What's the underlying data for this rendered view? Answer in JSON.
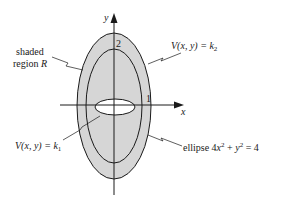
{
  "diagram": {
    "axes": {
      "x_label": "x",
      "y_label": "y"
    },
    "tick_labels": {
      "y_tick": "2",
      "x_tick": "1"
    },
    "labels": {
      "shaded_region_line1": "shaded",
      "shaded_region_line2": "region",
      "shaded_region_var": "R",
      "level_k2_prefix": "V(x, y) = k",
      "level_k2_sub": "2",
      "level_k1_prefix": "V(x, y) = k",
      "level_k1_sub": "1",
      "ellipse_prefix": "ellipse 4",
      "ellipse_x": "x",
      "ellipse_x_exp": "2",
      "ellipse_plus": " + ",
      "ellipse_y": "y",
      "ellipse_y_exp": "2",
      "ellipse_rhs": " = 4"
    },
    "colors": {
      "shade": "#d6d6d6",
      "stroke": "#1a1a1a",
      "background": "#ffffff"
    }
  }
}
